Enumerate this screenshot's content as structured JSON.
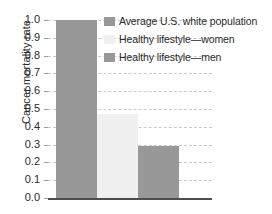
{
  "chart_data": {
    "type": "bar",
    "title": "",
    "xlabel": "",
    "ylabel": "Cancer mortality rate",
    "ylim": [
      0.0,
      1.0
    ],
    "grid": true,
    "legend_position": "upper-right",
    "categories": [
      "Average U.S. white population",
      "Healthy lifestyle—women",
      "Healthy lifestyle—men"
    ],
    "values": [
      1.0,
      0.47,
      0.295
    ],
    "colors": [
      "#989898",
      "#f0f0f0",
      "#989898"
    ],
    "ytick_labels": [
      "1.0",
      "0.9",
      "0.8",
      "0.7",
      "0.6",
      "0.5",
      "0.4",
      "0.3",
      "0.2",
      "0.1",
      "0.0"
    ],
    "ytick_values": [
      1.0,
      0.9,
      0.8,
      0.7,
      0.6,
      0.5,
      0.4,
      0.3,
      0.2,
      0.1,
      0.0
    ]
  },
  "axis": {
    "y_title": "Cancer mortality rate"
  },
  "legend": {
    "entries": [
      {
        "label": "Average U.S. white population",
        "color": "#989898"
      },
      {
        "label": "Healthy lifestyle—women",
        "color": "#f0f0f0"
      },
      {
        "label": "Healthy lifestyle—men",
        "color": "#989898"
      }
    ]
  },
  "style": {
    "background": "#ffffff",
    "gridline_color": "#c9c9c9",
    "axis_color": "#4d4d4d",
    "text_color": "#2b2b2b"
  }
}
